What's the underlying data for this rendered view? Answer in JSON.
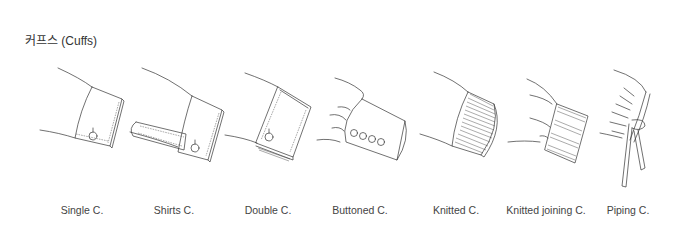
{
  "title": "커프스 (Cuffs)",
  "items": [
    {
      "id": "single",
      "label": "Single C.",
      "x": 82
    },
    {
      "id": "shirts",
      "label": "Shirts C.",
      "x": 174
    },
    {
      "id": "double",
      "label": "Double C.",
      "x": 268
    },
    {
      "id": "buttoned",
      "label": "Buttoned C.",
      "x": 360
    },
    {
      "id": "knitted",
      "label": "Knitted C.",
      "x": 456
    },
    {
      "id": "knitted-joining",
      "label": "Knitted joining C.",
      "x": 546
    },
    {
      "id": "piping",
      "label": "Piping C.",
      "x": 628
    }
  ]
}
